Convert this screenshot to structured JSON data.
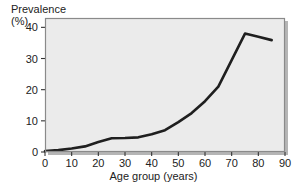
{
  "chart_data": {
    "type": "line",
    "title": "",
    "xlabel": "Age group (years)",
    "ylabel": "Prevalence (%)",
    "ylabel_lines": [
      "Prevalence",
      "(%)"
    ],
    "xlim": [
      0,
      90
    ],
    "ylim": [
      0,
      43
    ],
    "xticks": [
      0,
      10,
      20,
      30,
      40,
      50,
      60,
      70,
      80,
      90
    ],
    "xtick_labels": [
      "0",
      "10",
      "20",
      "30",
      "40",
      "50",
      "60",
      "70",
      "80",
      "90"
    ],
    "yticks": [
      0,
      10,
      20,
      30,
      40
    ],
    "ytick_labels": [
      "0",
      "10",
      "20",
      "30",
      "40"
    ],
    "grid": false,
    "legend": false,
    "series": [
      {
        "name": "Prevalence",
        "color": "#1f1f1f",
        "line_width": 2.6,
        "x": [
          0,
          5,
          10,
          15,
          20,
          25,
          30,
          35,
          40,
          45,
          50,
          55,
          60,
          65,
          70,
          75,
          80,
          85
        ],
        "y": [
          0.3,
          0.6,
          1.1,
          1.8,
          3.2,
          4.4,
          4.5,
          4.7,
          5.7,
          7.0,
          9.6,
          12.5,
          16.3,
          21.0,
          29.5,
          38.0,
          37.0,
          35.9
        ]
      }
    ],
    "plot_area": {
      "left": 45,
      "top": 18,
      "right": 285,
      "bottom": 152,
      "background": "#ebebeb",
      "border_color": "#8a8a8a",
      "shadow_color": "#b5b5b5"
    },
    "annotations": []
  }
}
